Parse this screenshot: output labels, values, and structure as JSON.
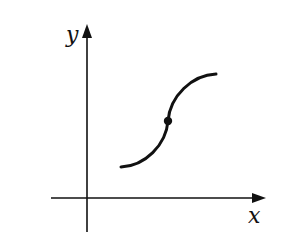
{
  "figure": {
    "axes": {
      "x_label": "x",
      "y_label": "y",
      "color": "#111111"
    },
    "curve": {
      "description": "S-shaped increasing curve with an inflection point",
      "points": {
        "start": [
          121,
          167
        ],
        "inflection": [
          168,
          121
        ],
        "end": [
          216,
          74
        ]
      },
      "color": "#111111"
    },
    "marker": {
      "label": "inflection point",
      "color": "#111111"
    }
  }
}
